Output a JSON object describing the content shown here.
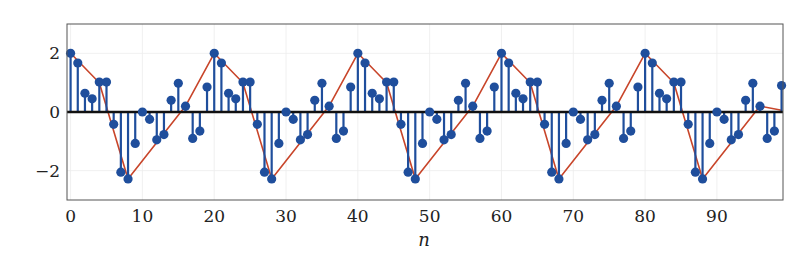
{
  "chart_data": {
    "type": "stem",
    "title": "",
    "xlabel": "n",
    "ylabel": "",
    "xlim": [
      -0.5,
      99.2
    ],
    "ylim": [
      -3,
      3
    ],
    "grid": true,
    "legend": null,
    "xticks": [
      0,
      10,
      20,
      30,
      40,
      50,
      60,
      70,
      80,
      90
    ],
    "xtick_labels": [
      "0",
      "10",
      "20",
      "30",
      "40",
      "50",
      "60",
      "70",
      "80",
      "90"
    ],
    "yticks": [
      2,
      0,
      -2
    ],
    "ytick_labels": [
      "2",
      "0",
      "−2"
    ],
    "period": 20,
    "series": [
      {
        "name": "x[n] (stem)",
        "kind": "stem",
        "color": "#1f4e9c",
        "x": [
          0,
          1,
          2,
          3,
          4,
          5,
          6,
          7,
          8,
          9,
          10,
          11,
          12,
          13,
          14,
          15,
          16,
          17,
          18,
          19,
          20,
          21,
          22,
          23,
          24,
          25,
          26,
          27,
          28,
          29,
          30,
          31,
          32,
          33,
          34,
          35,
          36,
          37,
          38,
          39,
          40,
          41,
          42,
          43,
          44,
          45,
          46,
          47,
          48,
          49,
          50,
          51,
          52,
          53,
          54,
          55,
          56,
          57,
          58,
          59,
          60,
          61,
          62,
          63,
          64,
          65,
          66,
          67,
          68,
          69,
          70,
          71,
          72,
          73,
          74,
          75,
          76,
          77,
          78,
          79,
          80,
          81,
          82,
          83,
          84,
          85,
          86,
          87,
          88,
          89,
          90,
          91,
          92,
          93,
          94,
          95,
          96,
          97,
          98,
          99
        ],
        "values": [
          2.0,
          1.67,
          0.64,
          0.45,
          1.02,
          1.02,
          -0.42,
          -2.05,
          -2.28,
          -1.07,
          0.0,
          -0.25,
          -0.95,
          -0.77,
          0.4,
          0.98,
          0.2,
          -0.9,
          -0.65,
          0.85,
          2.0,
          1.67,
          0.64,
          0.45,
          1.02,
          1.02,
          -0.42,
          -2.05,
          -2.28,
          -1.07,
          0.0,
          -0.25,
          -0.95,
          -0.77,
          0.4,
          0.98,
          0.2,
          -0.9,
          -0.65,
          0.85,
          2.0,
          1.67,
          0.64,
          0.45,
          1.02,
          1.02,
          -0.42,
          -2.05,
          -2.28,
          -1.07,
          0.0,
          -0.25,
          -0.95,
          -0.77,
          0.4,
          0.98,
          0.2,
          -0.9,
          -0.65,
          0.85,
          2.0,
          1.67,
          0.64,
          0.45,
          1.02,
          1.02,
          -0.42,
          -2.05,
          -2.28,
          -1.07,
          0.0,
          -0.25,
          -0.95,
          -0.77,
          0.4,
          0.98,
          0.2,
          -0.9,
          -0.65,
          0.85,
          2.0,
          1.67,
          0.64,
          0.45,
          1.02,
          1.02,
          -0.42,
          -2.05,
          -2.28,
          -1.07,
          0.0,
          -0.25,
          -0.95,
          -0.77,
          0.4,
          0.98,
          0.2,
          -0.9,
          -0.65,
          0.9
        ]
      },
      {
        "name": "envelope (line)",
        "kind": "line",
        "color": "#c8452a",
        "x": [
          0,
          4,
          8,
          16,
          20,
          24,
          28,
          36,
          40,
          44,
          48,
          56,
          60,
          64,
          68,
          76,
          80,
          84,
          88,
          96,
          99
        ],
        "values": [
          2.0,
          1.0,
          -2.28,
          0.2,
          2.0,
          1.0,
          -2.28,
          0.2,
          2.0,
          1.0,
          -2.28,
          0.2,
          2.0,
          1.0,
          -2.28,
          0.2,
          2.0,
          1.0,
          -2.28,
          0.2,
          0.06
        ]
      }
    ]
  }
}
